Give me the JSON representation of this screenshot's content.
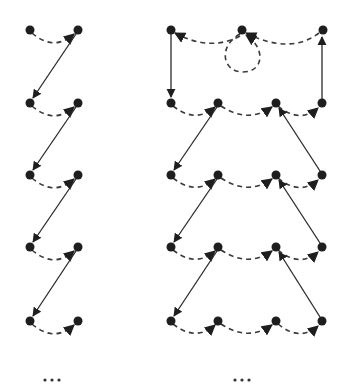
{
  "diagram": {
    "colors": {
      "node": "#1e1e1e",
      "edge": "#2a2a2a",
      "background": "#ffffff"
    },
    "left_graph": {
      "rows": 5,
      "nodes_per_row": 2,
      "node_x": [
        30,
        78
      ],
      "row_y": [
        30,
        103,
        175,
        247,
        321
      ],
      "dashed_edges": "left node to right node in each row (curved, arrow into right node)",
      "solid_edges": "right node of row i to left node of row i+1 (arrow into lower-left node)",
      "ellipsis": "…"
    },
    "right_graph": {
      "top_row": {
        "node_x": [
          171,
          242,
          323
        ],
        "y": 30,
        "self_loop_on_middle": true
      },
      "rows_below": 4,
      "node_x": [
        171,
        218,
        276,
        322
      ],
      "row_y": [
        103,
        175,
        247,
        321
      ],
      "dashed_edges": "consecutive nodes in each row, arrows pointing rightward",
      "solid_edges": "vertical edges on outer sides of top band; diagonals forming V between rows",
      "ellipsis": "…"
    }
  },
  "labels": {
    "left_ellipsis": "•••",
    "right_ellipsis": "•••"
  }
}
